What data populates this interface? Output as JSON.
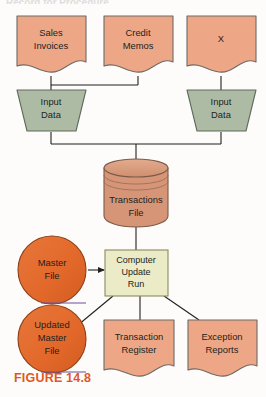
{
  "figure": {
    "caption": "FIGURE 14.8",
    "caption_color": "#e2571f",
    "top_cut_text": "Record for Procedure"
  },
  "palette": {
    "document_fill": "#eda786",
    "document_stroke": "#6d6a66",
    "input_fill": "#aebba4",
    "input_stroke": "#5e6b5a",
    "cylinder_fill": "#d79578",
    "cylinder_stroke": "#7a5a48",
    "tape_fill": "#e2682a",
    "tape_stroke": "#8c3f14",
    "process_fill": "#ecebc7",
    "process_stroke": "#8a8a5e",
    "connector": "#231f1d",
    "text": "#231f1d",
    "background": "#fdfcfb"
  },
  "nodes": {
    "sales_invoices": {
      "label_line1": "Sales",
      "label_line2": "Invoices",
      "shape": "document"
    },
    "credit_memos": {
      "label_line1": "Credit",
      "label_line2": "Memos",
      "shape": "document"
    },
    "x_document": {
      "label_line1": "X",
      "label_line2": "",
      "shape": "document"
    },
    "input_data_left": {
      "label_line1": "Input",
      "label_line2": "Data",
      "shape": "manual-input-trapezoid"
    },
    "input_data_right": {
      "label_line1": "Input",
      "label_line2": "Data",
      "shape": "manual-input-trapezoid"
    },
    "transactions_file": {
      "label_line1": "Transactions",
      "label_line2": "File",
      "shape": "cylinder-disk-storage"
    },
    "master_file": {
      "label_line1": "Master",
      "label_line2": "File",
      "label_line3": "",
      "shape": "magnetic-tape-circle"
    },
    "computer_update_run": {
      "label_line1": "Computer",
      "label_line2": "Update",
      "label_line3": "Run",
      "shape": "process-rectangle"
    },
    "updated_master_file": {
      "label_line1": "Updated",
      "label_line2": "Master",
      "label_line3": "File",
      "shape": "magnetic-tape-circle"
    },
    "transaction_register": {
      "label_line1": "Transaction",
      "label_line2": "Register",
      "shape": "document"
    },
    "exception_reports": {
      "label_line1": "Exception",
      "label_line2": "Reports",
      "shape": "document"
    }
  },
  "flows": [
    {
      "from": "sales_invoices",
      "to": "input_data_left",
      "arrow": false
    },
    {
      "from": "credit_memos",
      "to": "input_data_left",
      "arrow": false
    },
    {
      "from": "x_document",
      "to": "input_data_right",
      "arrow": false
    },
    {
      "from": "input_data_left",
      "to": "transactions_file",
      "arrow": false
    },
    {
      "from": "input_data_right",
      "to": "transactions_file",
      "arrow": false
    },
    {
      "from": "transactions_file",
      "to": "computer_update_run",
      "arrow": false
    },
    {
      "from": "master_file",
      "to": "computer_update_run",
      "arrow": true
    },
    {
      "from": "computer_update_run",
      "to": "updated_master_file",
      "arrow": true
    },
    {
      "from": "computer_update_run",
      "to": "transaction_register",
      "arrow": false
    },
    {
      "from": "computer_update_run",
      "to": "exception_reports",
      "arrow": false
    }
  ]
}
